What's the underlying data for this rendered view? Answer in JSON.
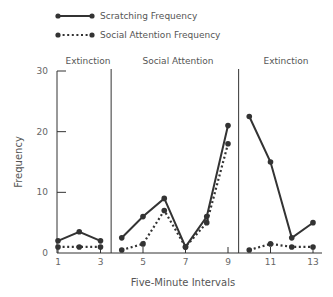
{
  "chart_data": {
    "type": "line",
    "title": "",
    "xlabel": "Five-Minute Intervals",
    "ylabel": "Frequency",
    "xlim": [
      1,
      13
    ],
    "ylim": [
      0,
      30
    ],
    "y_ticks": [
      0,
      10,
      20,
      30
    ],
    "x_ticks": [
      1,
      3,
      5,
      7,
      9,
      11,
      13
    ],
    "grid": false,
    "legend_position": "top-left",
    "phases": [
      {
        "label": "Extinction",
        "start": 1,
        "end": 3
      },
      {
        "label": "Social Attention",
        "start": 4,
        "end": 9
      },
      {
        "label": "Extinction",
        "start": 10,
        "end": 13
      }
    ],
    "phase_dividers": [
      3.5,
      9.5
    ],
    "series": [
      {
        "name": "Scratching Frequency",
        "style": "solid",
        "segments": [
          {
            "x": [
              1,
              2,
              3
            ],
            "values": [
              2,
              3.5,
              2
            ]
          },
          {
            "x": [
              4,
              5,
              6,
              7,
              8,
              9
            ],
            "values": [
              2.5,
              6,
              9,
              1,
              6,
              21
            ]
          },
          {
            "x": [
              10,
              11,
              12,
              13
            ],
            "values": [
              22.5,
              15,
              2.5,
              5
            ]
          }
        ]
      },
      {
        "name": "Social Attention Frequency",
        "style": "dotted",
        "segments": [
          {
            "x": [
              1,
              2,
              3
            ],
            "values": [
              1,
              1,
              1
            ]
          },
          {
            "x": [
              4,
              5,
              6,
              7,
              8,
              9
            ],
            "values": [
              0.5,
              1.5,
              7,
              1,
              5,
              18
            ]
          },
          {
            "x": [
              10,
              11,
              12,
              13
            ],
            "values": [
              0.5,
              1.5,
              1,
              1
            ]
          }
        ]
      }
    ]
  },
  "legend": {
    "items": [
      {
        "label": "Scratching Frequency",
        "style": "solid"
      },
      {
        "label": "Social Attention Frequency",
        "style": "dotted"
      }
    ]
  },
  "colors": {
    "line": "#333333",
    "text": "#555555"
  }
}
